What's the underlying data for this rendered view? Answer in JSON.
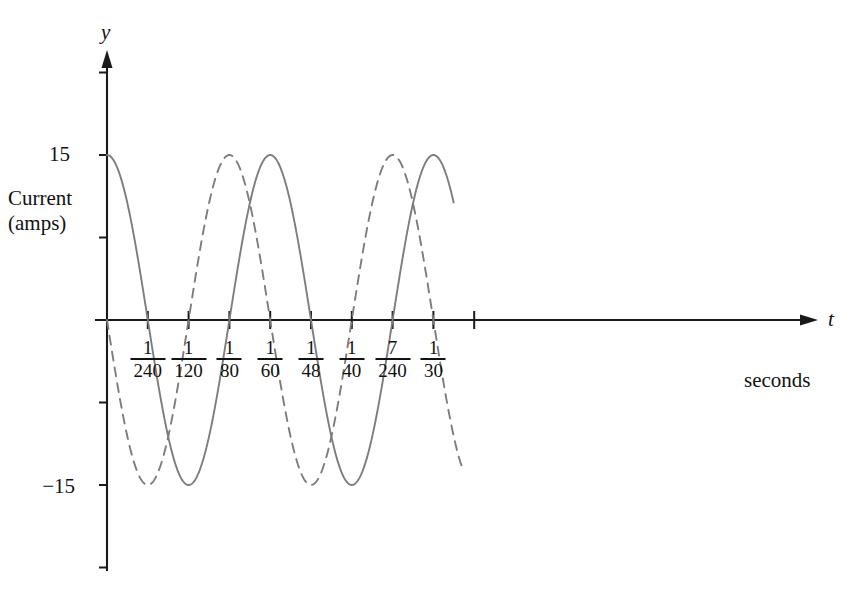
{
  "figure": {
    "background_color": "#ffffff",
    "curve_color": "#7d7d7d",
    "axis_color": "#1a1a1a",
    "text_color": "#111111"
  },
  "axes": {
    "y_axis_name": "y",
    "x_axis_name": "t",
    "y_axis_label_line1": "Current",
    "y_axis_label_line2": "(amps)",
    "x_unit_label": "seconds",
    "y_tick_labels": [
      {
        "value": 15,
        "text": "15"
      },
      {
        "value": -15,
        "text": "−15"
      }
    ],
    "x_tick_fractions": [
      {
        "numerator": "1",
        "denominator": "240",
        "value": 0.0041667
      },
      {
        "numerator": "1",
        "denominator": "120",
        "value": 0.0083333
      },
      {
        "numerator": "1",
        "denominator": "80",
        "value": 0.0125
      },
      {
        "numerator": "1",
        "denominator": "60",
        "value": 0.0166667
      },
      {
        "numerator": "1",
        "denominator": "48",
        "value": 0.0208333
      },
      {
        "numerator": "1",
        "denominator": "40",
        "value": 0.025
      },
      {
        "numerator": "7",
        "denominator": "240",
        "value": 0.0291667
      },
      {
        "numerator": "1",
        "denominator": "30",
        "value": 0.0333333
      }
    ]
  },
  "chart_data": {
    "type": "line",
    "title": "",
    "subtitle": "",
    "xlabel": "seconds",
    "ylabel": "Current (amps)",
    "xlim": [
      0,
      0.0375
    ],
    "ylim": [
      -22.5,
      22.5
    ],
    "grid": false,
    "legend": "none",
    "x_axis_variable": "t",
    "y_axis_variable": "y",
    "x_tick_values": [
      0.0041667,
      0.0083333,
      0.0125,
      0.0166667,
      0.0208333,
      0.025,
      0.0291667,
      0.0333333
    ],
    "x_tick_text": [
      "1/240",
      "1/120",
      "1/80",
      "1/60",
      "1/48",
      "1/40",
      "7/240",
      "1/30"
    ],
    "y_tick_values": [
      -22.5,
      -15,
      -7.5,
      7.5,
      15,
      22.5
    ],
    "y_tick_text": [
      "",
      "−15",
      "",
      "",
      "15",
      ""
    ],
    "series": [
      {
        "name": "solid-current-wave",
        "style": "solid",
        "color": "#7d7d7d",
        "amplitude": 15,
        "period": 0.0166667,
        "frequency_hz": 60,
        "phase_shift_seconds": 0,
        "equation": "y = 15 cos(120πt)",
        "x_start": 0,
        "x_end": 0.0354,
        "x": [
          0,
          0.0020833,
          0.0041667,
          0.00625,
          0.0083333,
          0.0104167,
          0.0125,
          0.0145833,
          0.0166667,
          0.01875,
          0.0208333,
          0.0229167,
          0.025,
          0.0270833,
          0.0291667,
          0.03125,
          0.0333333,
          0.0354167
        ],
        "y": [
          15,
          10.6,
          0,
          -10.6,
          -15,
          -10.6,
          0,
          10.6,
          15,
          10.6,
          0,
          -10.6,
          -15,
          -10.6,
          0,
          10.6,
          15,
          10.6
        ]
      },
      {
        "name": "dashed-current-wave",
        "style": "dashed",
        "color": "#7d7d7d",
        "amplitude": 15,
        "period": 0.0166667,
        "frequency_hz": 60,
        "phase_shift_seconds": 0.0041667,
        "equation": "y = 15 cos(120πt + π/2)",
        "x_start": 0,
        "x_end": 0.0364,
        "x": [
          0,
          0.0020833,
          0.0041667,
          0.00625,
          0.0083333,
          0.0104167,
          0.0125,
          0.0145833,
          0.0166667,
          0.01875,
          0.0208333,
          0.0229167,
          0.025,
          0.0270833,
          0.0291667,
          0.03125,
          0.0333333,
          0.0354167,
          0.0364583
        ],
        "y": [
          10.6,
          0,
          -10.6,
          -15,
          -10.6,
          0,
          10.6,
          15,
          10.6,
          0,
          -10.6,
          -15,
          -10.6,
          0,
          10.6,
          15,
          10.6,
          0,
          -4.5
        ]
      }
    ],
    "annotations": [
      {
        "name": "y-max-tick",
        "text": "15",
        "at_value": 15
      },
      {
        "name": "y-min-tick",
        "text": "−15",
        "at_value": -15
      }
    ]
  }
}
